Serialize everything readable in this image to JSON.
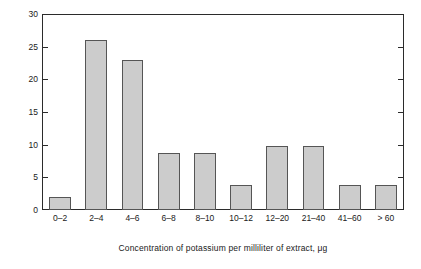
{
  "chart_data": {
    "type": "bar",
    "title": "",
    "xlabel": "Concentration of potassium per milliliter of extract, μg",
    "ylabel": "Proportion of samples, %",
    "categories": [
      "0–2",
      "2–4",
      "4–6",
      "6–8",
      "8–10",
      "10–12",
      "12–20",
      "21–40",
      "41–60",
      "> 60"
    ],
    "values": [
      2.0,
      26.0,
      23.0,
      8.8,
      8.8,
      3.9,
      9.8,
      9.8,
      3.9,
      3.9
    ],
    "ylim": [
      0,
      30
    ],
    "yticks": [
      0,
      5,
      10,
      15,
      20,
      25,
      30
    ],
    "ytick_labels": [
      "0",
      "5",
      "10",
      "15",
      "20",
      "25",
      "30"
    ],
    "grid": false,
    "legend": null,
    "bar_color": "#cccccc",
    "bar_edge_color": "#555555",
    "axis_color": "#2b2b2b",
    "background": "#ffffff"
  }
}
